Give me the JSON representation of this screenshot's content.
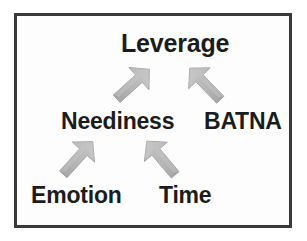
{
  "diagram": {
    "type": "flow-diagram",
    "background_color": "#fdfdfd",
    "border_color": "#3a3a3c",
    "text_color": "#1c1c1c",
    "arrow_color": "#a9a9a9",
    "nodes": [
      {
        "id": "leverage",
        "label": "Leverage"
      },
      {
        "id": "neediness",
        "label": "Neediness"
      },
      {
        "id": "batna",
        "label": "BATNA"
      },
      {
        "id": "emotion",
        "label": "Emotion"
      },
      {
        "id": "time",
        "label": "Time"
      }
    ],
    "arrows": [
      {
        "id": "neediness-to-leverage",
        "from": "Neediness",
        "to": "Leverage",
        "direction": "up-right"
      },
      {
        "id": "batna-to-leverage",
        "from": "BATNA",
        "to": "Leverage",
        "direction": "up-left"
      },
      {
        "id": "emotion-to-neediness",
        "from": "Emotion",
        "to": "Neediness",
        "direction": "up-right"
      },
      {
        "id": "time-to-neediness",
        "from": "Time",
        "to": "Neediness",
        "direction": "up-left"
      }
    ]
  }
}
